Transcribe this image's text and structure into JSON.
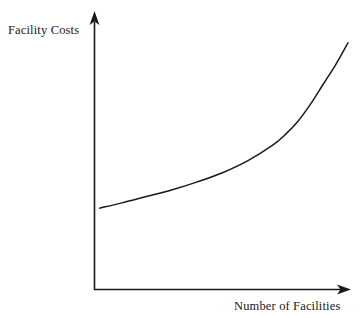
{
  "chart_data": {
    "type": "line",
    "title": "",
    "subtitle": "",
    "xlabel": "Number of Facilities",
    "ylabel": "Facility Costs",
    "grid": false,
    "legend": false,
    "legend_position": "none",
    "axis_style": "arrow-axes-no-ticks",
    "xlim": [
      0,
      100
    ],
    "ylim": [
      0,
      100
    ],
    "xticks": [],
    "yticks": [],
    "xticklabels": [],
    "yticklabels": [],
    "annotations": [],
    "series": [
      {
        "name": "Facility Costs",
        "color": "#1a1a1a",
        "x": [
          1,
          10,
          20,
          30,
          40,
          50,
          60,
          70,
          75,
          80,
          85,
          90,
          95,
          98,
          100
        ],
        "y": [
          31,
          33,
          35.5,
          38,
          41,
          44.5,
          49,
          55,
          59,
          64,
          70.5,
          78,
          85.5,
          90.5,
          94
        ]
      }
    ]
  },
  "labels": {
    "y_axis": "Facility Costs",
    "x_axis": "Number of Facilities"
  },
  "colors": {
    "stroke": "#1a1a1a",
    "background": "#ffffff"
  }
}
